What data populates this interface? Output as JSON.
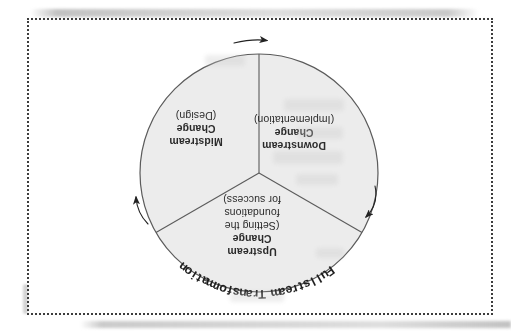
{
  "figure": {
    "title_arc": "Fullstream Transformation",
    "segments": [
      {
        "title_lines": [
          "Upstream",
          "Change"
        ],
        "detail_lines": [
          "(Setting the",
          "foundations",
          "for success)"
        ]
      },
      {
        "title_lines": [
          "Downstream",
          "Change"
        ],
        "detail_lines": [
          "(Implementation)"
        ]
      },
      {
        "title_lines": [
          "Midstream",
          "Change"
        ],
        "detail_lines": [
          "(Design)"
        ]
      }
    ]
  },
  "colors": {
    "circle_fill": "#ececec",
    "line": "#5b5b5b",
    "arrow": "#222222",
    "text": "#2b2b2b",
    "arc_text": "#1f1f1f",
    "border_dot": "#3d3d3d"
  }
}
